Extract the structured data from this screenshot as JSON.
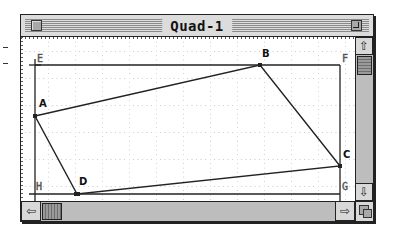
{
  "window": {
    "title": "Quad-1",
    "close_icon": "close-box",
    "zoom_icon": "zoom-box"
  },
  "canvas": {
    "grid_spacing_px": 27,
    "rectangle": {
      "corners": [
        {
          "label": "E",
          "x": 14,
          "y": 28
        },
        {
          "label": "F",
          "x": 319,
          "y": 28
        },
        {
          "label": "G",
          "x": 319,
          "y": 157
        },
        {
          "label": "H",
          "x": 14,
          "y": 157
        }
      ]
    },
    "quadrilateral": {
      "points": [
        {
          "label": "A",
          "x": 14,
          "y": 79
        },
        {
          "label": "B",
          "x": 239,
          "y": 28
        },
        {
          "label": "C",
          "x": 319,
          "y": 129
        },
        {
          "label": "D",
          "x": 56,
          "y": 157
        }
      ]
    },
    "labels": {
      "A": "A",
      "B": "B",
      "C": "C",
      "D": "D",
      "E": "E",
      "F": "F",
      "G": "G",
      "H": "H"
    }
  },
  "scrollbars": {
    "vertical": {
      "up_icon": "⇧",
      "down_icon": "⇩",
      "thumb_position": "top"
    },
    "horizontal": {
      "left_icon": "⇦",
      "right_icon": "⇨",
      "thumb_position": "left"
    }
  },
  "colors": {
    "titlebar": "#dcdcdc",
    "frame": "#222222",
    "scroll_track": "#bdbdbd",
    "grid_dot": "#9a9a9a"
  }
}
